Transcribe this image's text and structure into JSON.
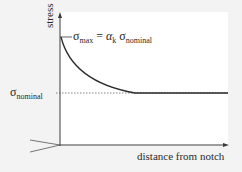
{
  "diagram": {
    "y_axis_label": "stress",
    "x_axis_label": "distance from notch",
    "sigma_max_label": {
      "symbol": "σ",
      "sub": "max",
      "eq": " = ",
      "alpha": "α",
      "alpha_sub": "k",
      "sigma": " σ",
      "sigma_sub": "nominal"
    },
    "sigma_nominal_label": {
      "symbol": "σ",
      "sub": "nominal"
    },
    "colors": {
      "curve": "#2a2a2a",
      "axes": "#3a3a3a",
      "dashed": "#555555",
      "panel": "#ffffff",
      "background": "#f3f3f3"
    }
  }
}
